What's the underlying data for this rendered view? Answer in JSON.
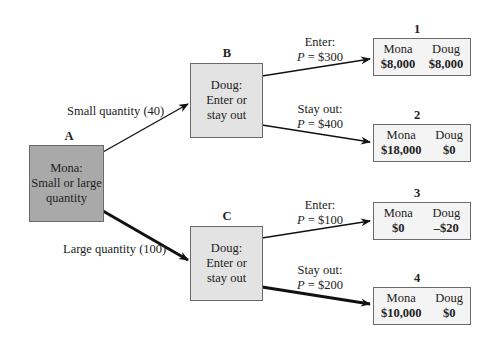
{
  "diagram": {
    "type": "game-tree",
    "nodes": {
      "A": {
        "label": "A",
        "lines": [
          "Mona:",
          "Small or large",
          "quantity"
        ]
      },
      "B": {
        "label": "B",
        "lines": [
          "Doug:",
          "Enter or",
          "stay out"
        ]
      },
      "C": {
        "label": "C",
        "lines": [
          "Doug:",
          "Enter or",
          "stay out"
        ]
      }
    },
    "edges": {
      "a_to_b": {
        "text": "Small quantity (40)"
      },
      "a_to_c": {
        "text": "Large quantity (100)"
      },
      "b_to_1": {
        "action": "Enter:",
        "price_var": "P",
        "price": " = $300"
      },
      "b_to_2": {
        "action": "Stay out:",
        "price_var": "P",
        "price": " = $400"
      },
      "c_to_3": {
        "action": "Enter:",
        "price_var": "P",
        "price": " = $100"
      },
      "c_to_4": {
        "action": "Stay out:",
        "price_var": "P",
        "price": " = $200"
      }
    },
    "outcomes": [
      {
        "number": "1",
        "player1": "Mona",
        "player2": "Doug",
        "payoff1": "$8,000",
        "payoff2": "$8,000"
      },
      {
        "number": "2",
        "player1": "Mona",
        "player2": "Doug",
        "payoff1": "$18,000",
        "payoff2": "$0"
      },
      {
        "number": "3",
        "player1": "Mona",
        "player2": "Doug",
        "payoff1": "$0",
        "payoff2": "–$20"
      },
      {
        "number": "4",
        "player1": "Mona",
        "player2": "Doug",
        "payoff1": "$10,000",
        "payoff2": "$0"
      }
    ],
    "colors": {
      "node_a_fill": "#a9a9a9",
      "node_doug_fill": "#e3e3e3",
      "payoff_fill": "#f4f4f4",
      "border": "#6a6a6a",
      "edge": "#111111"
    }
  }
}
